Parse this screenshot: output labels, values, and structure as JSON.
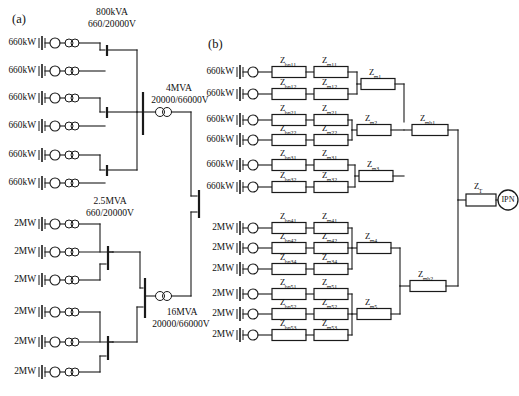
{
  "figure": {
    "panels": [
      {
        "tag": "(a)",
        "name": "single-line-diagram"
      },
      {
        "tag": "(b)",
        "name": "impedance-network"
      }
    ],
    "ink_color": "#1a1a1a",
    "background_color": "#ffffff"
  },
  "panel_a": {
    "tag": "(a)",
    "transformer_group_1": {
      "rating_line1": "800kVA",
      "rating_line2": "660/20000V"
    },
    "transformer_group_2": {
      "rating_line1": "2.5MVA",
      "rating_line2": "660/20000V"
    },
    "main_transformer_1": {
      "rating_line1": "4MVA",
      "rating_line2": "20000/66000V"
    },
    "main_transformer_2": {
      "rating_line1": "16MVA",
      "rating_line2": "20000/66000V"
    },
    "turbines_upper": [
      {
        "power": "660kW"
      },
      {
        "power": "660kW"
      },
      {
        "power": "660kW"
      },
      {
        "power": "660kW"
      },
      {
        "power": "660kW"
      },
      {
        "power": "660kW"
      }
    ],
    "turbines_lower": [
      {
        "power": "2MW"
      },
      {
        "power": "2MW"
      },
      {
        "power": "2MW"
      },
      {
        "power": "2MW"
      },
      {
        "power": "2MW"
      },
      {
        "power": "2MW"
      }
    ]
  },
  "panel_b": {
    "tag": "(b)",
    "turbines_upper": [
      {
        "power": "660kW",
        "z_branch": "Z",
        "z_branch_sub": "bn11",
        "z_main": "Z",
        "z_main_sub": "m11"
      },
      {
        "power": "660kW",
        "z_branch": "Z",
        "z_branch_sub": "bn12",
        "z_main": "Z",
        "z_main_sub": "m12"
      },
      {
        "power": "660kW",
        "z_branch": "Z",
        "z_branch_sub": "bn21",
        "z_main": "Z",
        "z_main_sub": "m21"
      },
      {
        "power": "660kW",
        "z_branch": "Z",
        "z_branch_sub": "bn22",
        "z_main": "Z",
        "z_main_sub": "m22"
      },
      {
        "power": "660kW",
        "z_branch": "Z",
        "z_branch_sub": "bn31",
        "z_main": "Z",
        "z_main_sub": "m31"
      },
      {
        "power": "660kW",
        "z_branch": "Z",
        "z_branch_sub": "bn32",
        "z_main": "Z",
        "z_main_sub": "m32"
      }
    ],
    "turbines_lower": [
      {
        "power": "2MW",
        "z_branch": "Z",
        "z_branch_sub": "bn41",
        "z_main": "Z",
        "z_main_sub": "m41"
      },
      {
        "power": "2MW",
        "z_branch": "Z",
        "z_branch_sub": "bn42",
        "z_main": "Z",
        "z_main_sub": "m42"
      },
      {
        "power": "2MW",
        "z_branch": "Z",
        "z_branch_sub": "bn34",
        "z_main": "Z",
        "z_main_sub": "m34"
      },
      {
        "power": "2MW",
        "z_branch": "Z",
        "z_branch_sub": "bn51",
        "z_main": "Z",
        "z_main_sub": "m51"
      },
      {
        "power": "2MW",
        "z_branch": "Z",
        "z_branch_sub": "bn52",
        "z_main": "Z",
        "z_main_sub": "m52"
      },
      {
        "power": "2MW",
        "z_branch": "Z",
        "z_branch_sub": "bn53",
        "z_main": "Z",
        "z_main_sub": "m53"
      }
    ],
    "feeder_impedances_upper": [
      {
        "symbol": "Z",
        "sub": "m1"
      },
      {
        "symbol": "Z",
        "sub": "m2"
      },
      {
        "symbol": "Z",
        "sub": "m3"
      }
    ],
    "feeder_impedances_lower": [
      {
        "symbol": "Z",
        "sub": "m4"
      },
      {
        "symbol": "Z",
        "sub": "m5"
      }
    ],
    "bus_impedances": [
      {
        "symbol": "Z",
        "sub": "mb1"
      },
      {
        "symbol": "Z",
        "sub": "mb2"
      }
    ],
    "transformer_impedance": {
      "symbol": "Z",
      "sub": "T"
    },
    "grid_node": {
      "label": "IPN"
    }
  }
}
